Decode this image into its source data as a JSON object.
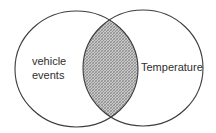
{
  "diagram": {
    "type": "venn",
    "sets": [
      {
        "id": "left",
        "label_lines": [
          "vehicle",
          "events"
        ],
        "cx": 76.5,
        "cy": 69,
        "rx": 61.5,
        "ry": 58
      },
      {
        "id": "right",
        "label_lines": [
          "Temperature"
        ],
        "cx": 143,
        "cy": 68,
        "rx": 60,
        "ry": 58
      }
    ],
    "intersection": {
      "fill": "crosshatch",
      "color": "#8a8a8a"
    },
    "colors": {
      "outline": "#3d3d3d",
      "text": "#2e2e2e",
      "background": "#ffffff",
      "hatch": "#8a8a8a"
    }
  }
}
